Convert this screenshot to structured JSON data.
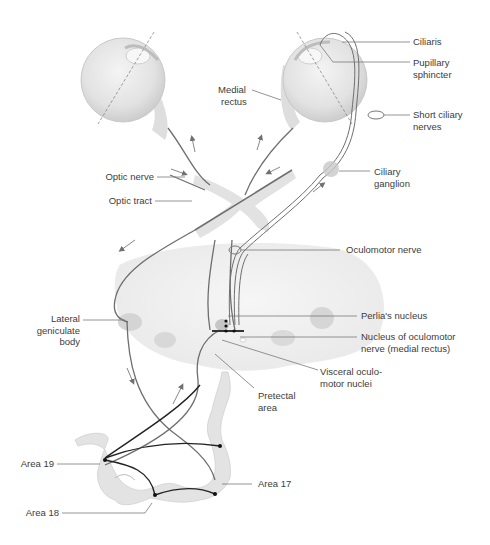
{
  "figure": {
    "labels": {
      "ciliaris": "Ciliaris",
      "pupillary_sphincter_1": "Pupillary",
      "pupillary_sphincter_2": "sphincter",
      "short_ciliary_1": "Short ciliary",
      "short_ciliary_2": "nerves",
      "ciliary_ganglion_1": "Ciliary",
      "ciliary_ganglion_2": "ganglion",
      "medial_rectus_1": "Medial",
      "medial_rectus_2": "rectus",
      "optic_nerve": "Optic nerve",
      "optic_tract": "Optic tract",
      "oculomotor_nerve": "Oculomotor nerve",
      "lateral_geniculate_1": "Lateral",
      "lateral_geniculate_2": "geniculate",
      "lateral_geniculate_3": "body",
      "perlias_nucleus": "Perlia's nucleus",
      "nucleus_oculomotor_1": "Nucleus of oculomotor",
      "nucleus_oculomotor_2": "nerve (medial rectus)",
      "visceral_1": "Visceral oculo-",
      "visceral_2": "motor nuclei",
      "pretectal_1": "Pretectal",
      "pretectal_2": "area",
      "area19": "Area 19",
      "area18": "Area 18",
      "area17": "Area 17"
    },
    "colors": {
      "tissue": "#e6e6e6",
      "tissue_dark": "#cfcfcf",
      "nerve": "#6e6e6e",
      "leader": "#7a7a7a",
      "cortex_fiber": "#222222",
      "arrow": "#707070"
    }
  }
}
